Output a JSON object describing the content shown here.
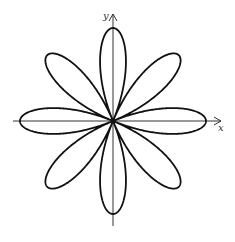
{
  "chart_data": {
    "type": "line",
    "title": "",
    "equation": "r = cos(4θ)",
    "curve": "polar rose",
    "petals": 8,
    "n": 4,
    "amplitude": 1,
    "xlabel": "x",
    "ylabel": "y",
    "xlim": [
      -1.1,
      1.1
    ],
    "ylim": [
      -1.1,
      1.1
    ],
    "grid": false,
    "legend": "none",
    "line_color": "#111111",
    "axis_color": "#333333"
  }
}
